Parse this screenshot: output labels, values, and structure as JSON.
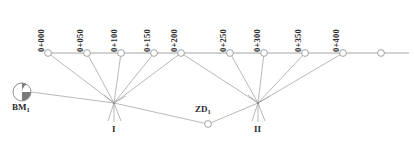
{
  "diagram": {
    "type": "survey-leveling-traverse",
    "colors": {
      "line": "#9a9a9a",
      "node_stroke": "#9a9a9a",
      "node_fill": "#ffffff",
      "text": "#2b2b2b",
      "benchmark_dark": "#7a7a7a",
      "benchmark_light": "#ffffff"
    },
    "chainage_labels": [
      {
        "text": "0+000",
        "x": 46,
        "y": 42
      },
      {
        "text": "0+050",
        "x": 85,
        "y": 42
      },
      {
        "text": "0+100",
        "x": 119,
        "y": 42
      },
      {
        "text": "0+150",
        "x": 152,
        "y": 42
      },
      {
        "text": "0+200",
        "x": 179,
        "y": 42
      },
      {
        "text": "0+250",
        "x": 228,
        "y": 42
      },
      {
        "text": "0+300",
        "x": 262,
        "y": 42
      },
      {
        "text": "0+350",
        "x": 303,
        "y": 42
      },
      {
        "text": "0+400",
        "x": 341,
        "y": 42
      }
    ],
    "chainage_nodes": [
      {
        "name": "0+000",
        "cx": 48,
        "cy": 53
      },
      {
        "name": "0+050",
        "cx": 87,
        "cy": 53
      },
      {
        "name": "0+100",
        "cx": 121,
        "cy": 53
      },
      {
        "name": "0+150",
        "cx": 154,
        "cy": 53
      },
      {
        "name": "0+200",
        "cx": 181,
        "cy": 53
      },
      {
        "name": "0+250",
        "cx": 230,
        "cy": 53
      },
      {
        "name": "0+300",
        "cx": 264,
        "cy": 53
      },
      {
        "name": "0+350",
        "cx": 305,
        "cy": 53
      },
      {
        "name": "0+400",
        "cx": 343,
        "cy": 53
      },
      {
        "name": "end",
        "cx": 381,
        "cy": 53
      }
    ],
    "baseline": {
      "x1": 48,
      "y1": 53,
      "x2": 409,
      "y2": 53
    },
    "instrument_stations": [
      {
        "name": "I",
        "label": "I",
        "x": 114,
        "y": 103,
        "label_x": 111,
        "label_y": 122
      },
      {
        "name": "II",
        "label": "II",
        "x": 258,
        "y": 103,
        "label_x": 253,
        "label_y": 122
      }
    ],
    "benchmark": {
      "label": "BM",
      "subscript": "1",
      "cx": 22,
      "cy": 92,
      "r": 9,
      "label_x": 12,
      "label_y": 106
    },
    "turning_point": {
      "label": "ZD",
      "subscript": "1",
      "cx": 208,
      "cy": 124,
      "label_x": 195,
      "label_y": 110
    },
    "sight_lines_station_1": [
      {
        "to": "0+000"
      },
      {
        "to": "0+050"
      },
      {
        "to": "0+100"
      },
      {
        "to": "0+150"
      },
      {
        "to": "0+200"
      },
      {
        "to": "BM1"
      },
      {
        "to": "ZD1"
      }
    ],
    "sight_lines_station_2": [
      {
        "to": "0+200"
      },
      {
        "to": "0+250"
      },
      {
        "to": "0+300"
      },
      {
        "to": "0+350"
      },
      {
        "to": "0+400"
      },
      {
        "to": "ZD1"
      }
    ]
  }
}
